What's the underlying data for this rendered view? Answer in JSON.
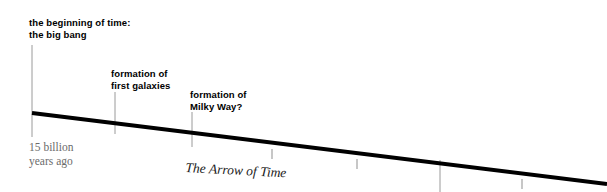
{
  "diagram": {
    "title": "The Arrow of Time",
    "background_color": "#ffffff",
    "line_color": "#000000",
    "leader_color": "#9a9a9a",
    "axis_text_color": "#6b6b6b",
    "events": [
      {
        "id": "big-bang",
        "line1": "the beginning of time:",
        "line2": "the big bang",
        "x": 32
      },
      {
        "id": "first-galaxies",
        "line1": "formation of",
        "line2": "first galaxies",
        "x": 115
      },
      {
        "id": "milky-way",
        "line1": "formation of",
        "line2": "Milky Way?",
        "x": 192
      }
    ],
    "axis": {
      "start_label_line1": "15 billion",
      "start_label_line2": "years ago",
      "caption": "The Arrow of Time",
      "start_x": 32,
      "start_y": 113,
      "end_x": 607,
      "end_y": 184
    },
    "tick_marks_x": [
      272,
      357,
      440,
      522
    ]
  }
}
